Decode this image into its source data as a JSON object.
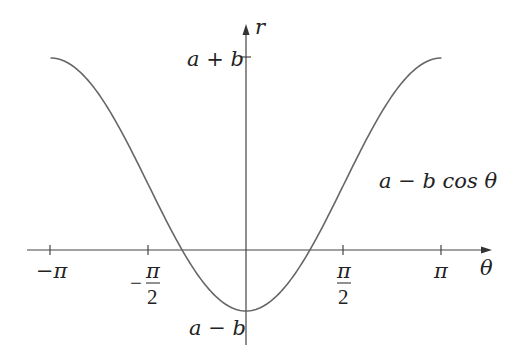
{
  "chart_data": {
    "type": "line",
    "title": "",
    "xlabel": "θ",
    "ylabel": "r",
    "function_label": "a − b cos θ",
    "x_ticks": [
      "−π",
      "−π/2",
      "π/2",
      "π"
    ],
    "y_ticks": [
      "a + b",
      "a − b"
    ],
    "xlim": [
      -3.14159,
      3.14159
    ],
    "series": [
      {
        "name": "a − b cos θ",
        "params": {
          "a_over_b": 0.52
        },
        "x": [
          -3.14159,
          -1.5708,
          0,
          1.5708,
          3.14159
        ],
        "y_labels": [
          "a + b",
          "a",
          "a − b",
          "a",
          "a + b"
        ]
      }
    ],
    "grid": false,
    "legend": "none"
  },
  "labels": {
    "r": "r",
    "theta": "θ",
    "a_plus_b": "a + b",
    "a_minus_b": "a − b",
    "func": "a − b cos θ",
    "neg_pi": "−π",
    "pi": "π",
    "half_num": "π",
    "half_den": "2",
    "minus": "−"
  }
}
